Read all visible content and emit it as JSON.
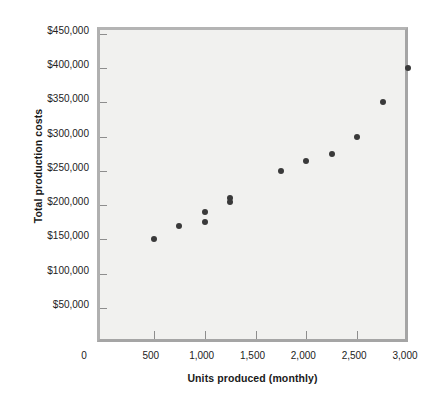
{
  "chart_data": {
    "type": "scatter",
    "title": "",
    "xlabel": "Units produced (monthly)",
    "ylabel": "Total production costs",
    "xlim": [
      0,
      3000
    ],
    "ylim": [
      0,
      450000
    ],
    "grid": false,
    "legend": null,
    "x_ticks": [
      0,
      500,
      1000,
      1500,
      2000,
      2500,
      3000
    ],
    "x_tick_labels": [
      "0",
      "500",
      "1,000",
      "1,500",
      "2,000",
      "2,500",
      "3,000"
    ],
    "y_ticks": [
      50000,
      100000,
      150000,
      200000,
      250000,
      300000,
      350000,
      400000,
      450000
    ],
    "y_tick_labels": [
      "$50,000",
      "$100,000",
      "$150,000",
      "$200,000",
      "$250,000",
      "$300,000",
      "$350,000",
      "$400,000",
      "$450,000"
    ],
    "marker_color": "#3a3a3a",
    "plot_background": "#f1f1ef",
    "frame_color": "#a9a9a9",
    "points": [
      {
        "x": 500,
        "y": 150000
      },
      {
        "x": 750,
        "y": 170000
      },
      {
        "x": 1000,
        "y": 190000
      },
      {
        "x": 1000,
        "y": 175000
      },
      {
        "x": 1250,
        "y": 210000
      },
      {
        "x": 1250,
        "y": 204000
      },
      {
        "x": 1750,
        "y": 250000
      },
      {
        "x": 2000,
        "y": 265000
      },
      {
        "x": 2250,
        "y": 275000
      },
      {
        "x": 2500,
        "y": 300000
      },
      {
        "x": 2750,
        "y": 350000
      },
      {
        "x": 3000,
        "y": 400000
      }
    ]
  }
}
